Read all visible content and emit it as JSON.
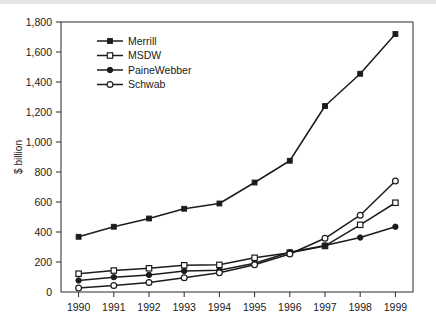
{
  "figure": {
    "background_color": "#ffffff",
    "line_color": "#1c1c1c",
    "top_band_color": "#e6e6e6"
  },
  "chart_data": {
    "type": "line",
    "title": "",
    "xlabel": "",
    "ylabel": "$ billion",
    "categories": [
      "1990",
      "1991",
      "1992",
      "1993",
      "1994",
      "1995",
      "1996",
      "1997",
      "1998",
      "1999"
    ],
    "x": [
      1990,
      1991,
      1992,
      1993,
      1994,
      1995,
      1996,
      1997,
      1998,
      1999
    ],
    "ylim": [
      0,
      1800
    ],
    "yticks": [
      0,
      200,
      400,
      600,
      800,
      1000,
      1200,
      1400,
      1600,
      1800
    ],
    "ytick_labels": [
      "0",
      "200",
      "400",
      "600",
      "800",
      "1,000",
      "1,200",
      "1,400",
      "1,600",
      "1,800"
    ],
    "grid": false,
    "legend_position": "upper-left",
    "series": [
      {
        "name": "Merrill",
        "marker": "filled-square",
        "values": [
          368,
          435,
          490,
          555,
          590,
          730,
          875,
          1240,
          1455,
          1720
        ]
      },
      {
        "name": "MSDW",
        "marker": "open-square",
        "values": [
          122,
          143,
          158,
          178,
          181,
          228,
          262,
          307,
          448,
          595
        ]
      },
      {
        "name": "PaineWebber",
        "marker": "filled-circle",
        "values": [
          77,
          99,
          114,
          140,
          145,
          192,
          265,
          310,
          363,
          435
        ]
      },
      {
        "name": "Schwab",
        "marker": "open-circle",
        "values": [
          26,
          43,
          63,
          95,
          128,
          182,
          253,
          358,
          512,
          740
        ]
      }
    ]
  }
}
